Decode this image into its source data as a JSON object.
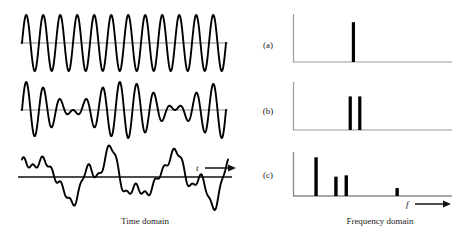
{
  "figure": {
    "row_labels": [
      {
        "id": "a",
        "text": "(a)"
      },
      {
        "id": "b",
        "text": "(b)"
      },
      {
        "id": "c",
        "text": "(c)"
      }
    ],
    "captions": {
      "time": "Time domain",
      "frequency": "Frequency domain"
    },
    "axis_labels": {
      "time": "t",
      "frequency": "f"
    },
    "colors": {
      "curve": "#000000",
      "axis": "#7a7a7a",
      "spectrum_line": "#000000",
      "text": "#1a1a1a",
      "background": "#ffffff"
    }
  },
  "chart_data": [
    {
      "type": "line",
      "id": "waveform-a",
      "panel": "(a)",
      "title": "",
      "xlabel": "t",
      "ylabel": "",
      "grid": false,
      "description": "Pure sinusoid, single frequency, constant amplitude",
      "xlim": [
        0,
        1
      ],
      "ylim": [
        -1.15,
        1.15
      ],
      "components": [
        {
          "frequency": 12,
          "amplitude": 1.0,
          "phase": 0
        }
      ]
    },
    {
      "type": "line",
      "id": "waveform-b",
      "panel": "(b)",
      "title": "",
      "xlabel": "t",
      "ylabel": "",
      "grid": false,
      "description": "Sum of two close frequencies producing beats with a node near mid-right",
      "xlim": [
        0,
        1
      ],
      "ylim": [
        -1.15,
        1.15
      ],
      "components": [
        {
          "frequency": 11,
          "amplitude": 0.55,
          "phase": 0
        },
        {
          "frequency": 13,
          "amplitude": 0.55,
          "phase": 0
        }
      ]
    },
    {
      "type": "line",
      "id": "waveform-c",
      "panel": "(c)",
      "title": "",
      "xlabel": "t",
      "ylabel": "",
      "grid": false,
      "description": "Complex periodic wave: strong low harmonic plus several higher harmonics",
      "xlim": [
        0,
        1
      ],
      "ylim": [
        -1.25,
        1.25
      ],
      "components": [
        {
          "frequency": 3,
          "amplitude": 0.72,
          "phase": 0.2
        },
        {
          "frequency": 7,
          "amplitude": 0.3,
          "phase": 1.1
        },
        {
          "frequency": 9,
          "amplitude": 0.26,
          "phase": 2.3
        },
        {
          "frequency": 22,
          "amplitude": 0.12,
          "phase": 0.6
        }
      ]
    },
    {
      "type": "bar",
      "id": "spectrum-a",
      "panel": "(a)",
      "title": "",
      "xlabel": "f",
      "ylabel": "",
      "grid": false,
      "description": "Single spectral line",
      "xlim": [
        0,
        1
      ],
      "ylim": [
        0,
        1
      ],
      "lines": [
        {
          "frequency": 0.38,
          "amplitude": 0.83
        }
      ]
    },
    {
      "type": "bar",
      "id": "spectrum-b",
      "panel": "(b)",
      "title": "",
      "xlabel": "f",
      "ylabel": "",
      "grid": false,
      "description": "Two closely spaced spectral lines of equal height",
      "xlim": [
        0,
        1
      ],
      "ylim": [
        0,
        1
      ],
      "lines": [
        {
          "frequency": 0.36,
          "amplitude": 0.7
        },
        {
          "frequency": 0.42,
          "amplitude": 0.7
        }
      ]
    },
    {
      "type": "bar",
      "id": "spectrum-c",
      "panel": "(c)",
      "title": "",
      "xlabel": "f",
      "ylabel": "",
      "grid": false,
      "description": "Four spectral lines of differing heights: a tall fundamental, two medium harmonics, one short high harmonic",
      "xlim": [
        0,
        1
      ],
      "ylim": [
        0,
        1
      ],
      "lines": [
        {
          "frequency": 0.145,
          "amplitude": 0.88
        },
        {
          "frequency": 0.27,
          "amplitude": 0.44
        },
        {
          "frequency": 0.335,
          "amplitude": 0.47
        },
        {
          "frequency": 0.655,
          "amplitude": 0.18
        }
      ]
    }
  ]
}
